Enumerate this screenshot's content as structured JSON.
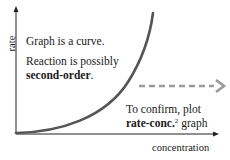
{
  "diagram": {
    "axes": {
      "y_label": "rate",
      "x_label": "concentration"
    },
    "curve": {
      "description": "upward curving line starting at origin, rising steeply",
      "color": "#555555"
    },
    "annotations": {
      "line1": "Graph is a curve.",
      "line2_prefix": "Reaction is possibly",
      "line2_bold": "second-order",
      "line2_suffix": ".",
      "confirm_line1": "To confirm, plot",
      "confirm_bold": "rate-conc.",
      "confirm_sup": "2",
      "confirm_suffix": " graph"
    },
    "dashed_arrow": {
      "color": "#9a9a9a",
      "direction": "right"
    }
  }
}
